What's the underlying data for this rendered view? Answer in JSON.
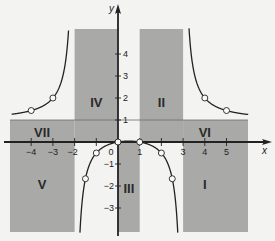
{
  "figure": {
    "function": "y = x(x-1) / ((x+2)(x-3))",
    "axes": {
      "x_label": "x",
      "y_label": "y",
      "x_ticks": [
        {
          "value": -4,
          "label": "−4"
        },
        {
          "value": -3,
          "label": "−3"
        },
        {
          "value": -2,
          "label": "−2"
        },
        {
          "value": -1,
          "label": ""
        },
        {
          "value": 0,
          "label": "0"
        },
        {
          "value": 1,
          "label": "1"
        },
        {
          "value": 2,
          "label": ""
        },
        {
          "value": 3,
          "label": "3"
        },
        {
          "value": 4,
          "label": "4"
        },
        {
          "value": 5,
          "label": "5"
        }
      ],
      "y_ticks": [
        {
          "value": 4,
          "label": "4"
        },
        {
          "value": 3,
          "label": "3"
        },
        {
          "value": 2,
          "label": "2"
        },
        {
          "value": 1,
          "label": "1"
        },
        {
          "value": -1,
          "label": "−1"
        },
        {
          "value": -2,
          "label": "−2"
        },
        {
          "value": -3,
          "label": "−3"
        }
      ]
    },
    "asymptotes": {
      "vertical": [
        -2,
        3
      ],
      "horizontal": 1
    },
    "regions": [
      {
        "label": "I",
        "x": 4,
        "y": -1.9
      },
      {
        "label": "II",
        "x": 2,
        "y": 1.8
      },
      {
        "label": "III",
        "x": 0.5,
        "y": -2.1
      },
      {
        "label": "IV",
        "x": -1,
        "y": 1.8
      },
      {
        "label": "V",
        "x": -3.5,
        "y": -1.9
      },
      {
        "label": "VI",
        "x": 4,
        "y": 0.45
      },
      {
        "label": "VII",
        "x": -3.5,
        "y": 0.45
      }
    ],
    "points": [
      {
        "x": -4,
        "y": 1.43
      },
      {
        "x": -3,
        "y": 2
      },
      {
        "x": -1.5,
        "y": -1.67
      },
      {
        "x": -1,
        "y": -0.5
      },
      {
        "x": 0,
        "y": 0
      },
      {
        "x": 1,
        "y": 0
      },
      {
        "x": 2,
        "y": -0.5
      },
      {
        "x": 2.5,
        "y": -1.67
      },
      {
        "x": 4,
        "y": 2
      },
      {
        "x": 5,
        "y": 1.43
      }
    ],
    "colors": {
      "shade": "#a9a9a7",
      "background": "#f3f3f1",
      "line": "#222222"
    }
  }
}
